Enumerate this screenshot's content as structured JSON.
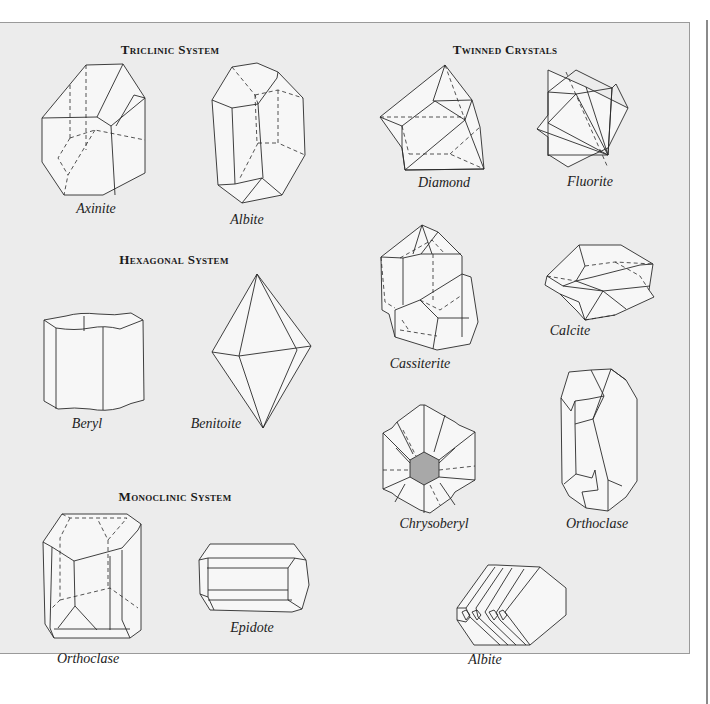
{
  "sections": {
    "triclinic": {
      "title": "Triclinic System",
      "crystals": [
        "Axinite",
        "Albite"
      ]
    },
    "hexagonal": {
      "title": "Hexagonal System",
      "crystals": [
        "Beryl",
        "Benitoite"
      ]
    },
    "monoclinic": {
      "title": "Monoclinic System",
      "crystals": [
        "Orthoclase",
        "Epidote"
      ]
    },
    "twinned": {
      "title": "Twinned Crystals",
      "crystals": [
        "Diamond",
        "Fluorite",
        "Cassiterite",
        "Calcite",
        "Chrysoberyl",
        "Orthoclase",
        "Albite"
      ]
    }
  },
  "colors": {
    "panel_background": "#ececec",
    "line": "#2a2a2a",
    "page_background": "#ffffff"
  }
}
